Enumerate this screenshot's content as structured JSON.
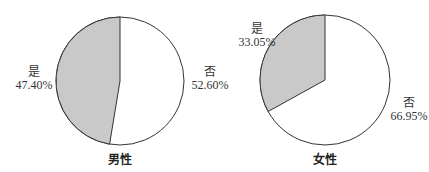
{
  "chart_data": [
    {
      "type": "pie",
      "title": "男性",
      "categories": [
        "是",
        "否"
      ],
      "values": [
        47.4,
        52.6
      ],
      "labels": [
        "47.40%",
        "52.60%"
      ],
      "colors": [
        "#c9c9c9",
        "#ffffff"
      ]
    },
    {
      "type": "pie",
      "title": "女性",
      "categories": [
        "是",
        "否"
      ],
      "values": [
        33.05,
        66.95
      ],
      "labels": [
        "33.05%",
        "66.95%"
      ],
      "colors": [
        "#c9c9c9",
        "#ffffff"
      ]
    }
  ],
  "charts": {
    "male": {
      "title": "男性",
      "yes": {
        "name": "是",
        "pct": "47.40%"
      },
      "no": {
        "name": "否",
        "pct": "52.60%"
      }
    },
    "female": {
      "title": "女性",
      "yes": {
        "name": "是",
        "pct": "33.05%"
      },
      "no": {
        "name": "否",
        "pct": "66.95%"
      }
    }
  }
}
